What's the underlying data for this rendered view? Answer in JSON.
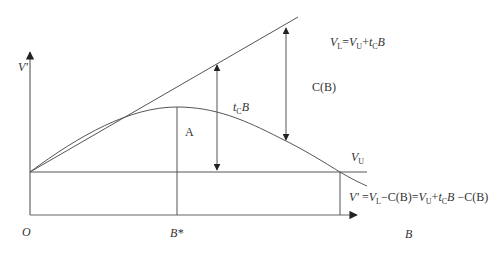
{
  "diagram": {
    "axes": {
      "origin_label": "O",
      "y_label": "V'",
      "x_label": "B",
      "x_tick_label": "B*"
    },
    "labels": {
      "line_top": {
        "V": "V",
        "L_sub": "L",
        "eq": "=",
        "V2": "V",
        "U_sub": "U",
        "plus": "+",
        "t": "t",
        "c_sub": "C",
        "B": "B"
      },
      "cost": "C(B)",
      "tax_gap": {
        "t": "t",
        "c_sub": "C",
        "B": "B"
      },
      "area": "A",
      "vu": {
        "V": "V",
        "U_sub": "U"
      },
      "bottom_eq": "V' =V₁−C(B)=Vᵤ+tᶜB −C(B)",
      "bottom_eq_parts": {
        "Vp": "V'",
        "eq1": " =",
        "V": "V",
        "L_sub": "L",
        "minus1": "−C(B)=",
        "V2": "V",
        "U_sub": "U",
        "plus": "+",
        "t": "t",
        "c_sub": "C",
        "B": "B",
        "minus2": " −C(B)"
      }
    },
    "colors": {
      "stroke": "#555555",
      "text": "#333333",
      "background": "#ffffff"
    }
  }
}
